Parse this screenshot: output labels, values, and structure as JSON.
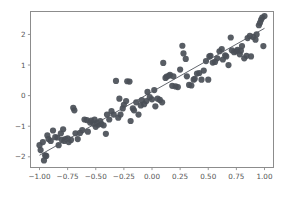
{
  "figure": {
    "background_color": "#ffffff",
    "axes_color": "#8c8c8c",
    "marker_color": "#4a4f57",
    "line_color": "#51565e"
  },
  "chart_data": {
    "type": "scatter",
    "title": "",
    "xlabel": "",
    "ylabel": "",
    "xlim": [
      -1.08,
      1.08
    ],
    "ylim": [
      -2.35,
      2.75
    ],
    "grid": false,
    "legend": null,
    "xticks": [
      -1.0,
      -0.75,
      -0.5,
      -0.25,
      0.0,
      0.25,
      0.5,
      0.75,
      1.0
    ],
    "xticklabels": [
      "-1.00",
      "-0.75",
      "-0.50",
      "-0.25",
      "0.00",
      "0.25",
      "0.50",
      "0.75",
      "1.00"
    ],
    "yticks": [
      -2,
      -1,
      0,
      1,
      2
    ],
    "yticklabels": [
      "-2",
      "-1",
      "0",
      "1",
      "2"
    ],
    "series": [
      {
        "name": "observations",
        "type": "scatter",
        "marker": "circle",
        "marker_size": 3.1,
        "color": "#4a4f57",
        "x": [
          -1.0,
          -0.99,
          -0.97,
          -0.96,
          -0.95,
          -0.94,
          -0.93,
          -0.92,
          -0.9,
          -0.88,
          -0.86,
          -0.84,
          -0.83,
          -0.81,
          -0.8,
          -0.79,
          -0.78,
          -0.77,
          -0.75,
          -0.74,
          -0.72,
          -0.7,
          -0.69,
          -0.68,
          -0.66,
          -0.64,
          -0.62,
          -0.6,
          -0.58,
          -0.57,
          -0.55,
          -0.54,
          -0.52,
          -0.51,
          -0.5,
          -0.49,
          -0.48,
          -0.46,
          -0.45,
          -0.43,
          -0.41,
          -0.4,
          -0.38,
          -0.36,
          -0.34,
          -0.32,
          -0.3,
          -0.29,
          -0.28,
          -0.26,
          -0.25,
          -0.23,
          -0.22,
          -0.2,
          -0.19,
          -0.17,
          -0.16,
          -0.14,
          -0.12,
          -0.1,
          -0.09,
          -0.07,
          -0.05,
          -0.04,
          -0.02,
          0.0,
          0.02,
          0.03,
          0.05,
          0.07,
          0.09,
          0.1,
          0.12,
          0.13,
          0.15,
          0.16,
          0.18,
          0.19,
          0.21,
          0.23,
          0.25,
          0.27,
          0.28,
          0.3,
          0.31,
          0.33,
          0.35,
          0.37,
          0.38,
          0.4,
          0.42,
          0.44,
          0.46,
          0.48,
          0.5,
          0.51,
          0.52,
          0.54,
          0.56,
          0.58,
          0.6,
          0.62,
          0.63,
          0.65,
          0.66,
          0.68,
          0.7,
          0.71,
          0.73,
          0.75,
          0.76,
          0.78,
          0.79,
          0.8,
          0.82,
          0.84,
          0.85,
          0.87,
          0.88,
          0.9,
          0.92,
          0.93,
          0.95,
          0.96,
          0.97,
          0.98,
          0.99,
          1.0
        ],
        "y": [
          -1.62,
          -1.78,
          -1.52,
          -2.12,
          -1.95,
          -1.97,
          -1.3,
          -1.42,
          -1.48,
          -1.14,
          -1.36,
          -1.37,
          -1.62,
          -1.23,
          -1.45,
          -1.1,
          -1.48,
          -1.42,
          -1.4,
          -1.52,
          -1.45,
          -0.4,
          -0.48,
          -1.23,
          -1.42,
          -1.22,
          -1.13,
          -0.78,
          -0.8,
          -1.18,
          -0.88,
          -0.82,
          -0.92,
          -0.78,
          -1.02,
          -0.88,
          -0.95,
          -0.83,
          -0.93,
          -0.97,
          -1.25,
          -0.62,
          -0.78,
          -0.51,
          -0.62,
          0.48,
          -0.72,
          -0.1,
          -0.62,
          -0.42,
          -0.3,
          -0.18,
          0.47,
          0.46,
          -0.83,
          -0.42,
          -0.48,
          -0.22,
          -0.62,
          -0.32,
          -0.15,
          -0.28,
          -0.18,
          0.12,
          -0.05,
          -0.12,
          0.18,
          -0.35,
          -0.1,
          -0.14,
          -0.22,
          1.07,
          0.58,
          0.62,
          0.65,
          0.68,
          0.32,
          0.63,
          0.3,
          0.28,
          0.85,
          1.63,
          1.38,
          1.2,
          0.63,
          0.35,
          0.33,
          0.52,
          0.55,
          0.72,
          0.74,
          0.52,
          0.82,
          1.13,
          0.52,
          1.28,
          1.3,
          1.08,
          1.1,
          1.22,
          1.45,
          1.52,
          1.18,
          1.32,
          1.28,
          1.0,
          1.9,
          1.48,
          1.42,
          1.45,
          1.5,
          1.35,
          1.47,
          1.62,
          1.22,
          1.3,
          1.88,
          1.95,
          1.28,
          1.92,
          1.83,
          2.0,
          2.3,
          2.38,
          2.48,
          2.55,
          1.62,
          2.6
        ]
      }
    ],
    "fit_line": {
      "name": "linear-fit",
      "type": "line",
      "color": "#51565e",
      "x": [
        -1.0,
        1.0
      ],
      "y": [
        -1.95,
        2.2
      ],
      "slope": 2.075,
      "intercept": 0.125
    }
  }
}
